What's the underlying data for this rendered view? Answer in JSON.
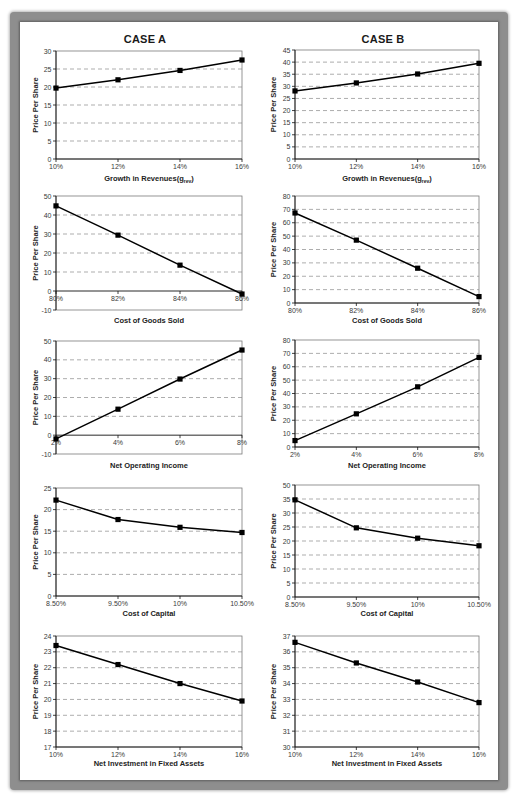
{
  "headings": {
    "case_a": "CASE A",
    "case_b": "CASE B"
  },
  "chart_data": [
    {
      "id": "case-a-growth-in-revenues",
      "case": "CASE A",
      "type": "line",
      "title": "",
      "xlabel": "Growth in Revenues(grev)",
      "xlabel_parts": [
        {
          "text": "Growth in Revenues(g"
        },
        {
          "text": "rev",
          "sub": true
        },
        {
          "text": ")"
        }
      ],
      "ylabel": "Price Per Share",
      "categories": [
        "10%",
        "12%",
        "14%",
        "16%"
      ],
      "values": [
        19.7,
        22.0,
        24.6,
        27.5
      ],
      "ylim": [
        0,
        30
      ],
      "yticks": [
        0,
        5,
        10,
        15,
        20,
        25,
        30
      ],
      "ytick_labels": [
        "0",
        "5",
        "10",
        "15",
        "20",
        "25",
        "30"
      ],
      "grid": true,
      "legend": null
    },
    {
      "id": "case-b-growth-in-revenues",
      "case": "CASE B",
      "type": "line",
      "title": "",
      "xlabel": "Growth in Revenues(grev)",
      "xlabel_parts": [
        {
          "text": "Growth in Revenues(g"
        },
        {
          "text": "rev",
          "sub": true
        },
        {
          "text": ")"
        }
      ],
      "ylabel": "Price Per Share",
      "categories": [
        "10%",
        "12%",
        "14%",
        "16%"
      ],
      "values": [
        28.1,
        31.4,
        35.1,
        39.5
      ],
      "ylim": [
        0,
        45
      ],
      "yticks": [
        0,
        5,
        10,
        15,
        20,
        25,
        30,
        35,
        40,
        45
      ],
      "ytick_labels": [
        "0",
        "5",
        "10",
        "15",
        "20",
        "25",
        "30",
        "35",
        "40",
        "45"
      ],
      "grid": true,
      "legend": null
    },
    {
      "id": "case-a-cost-of-goods-sold",
      "case": "CASE A",
      "type": "line",
      "title": "",
      "xlabel": "Cost of Goods Sold",
      "xlabel_parts": [
        {
          "text": "Cost of Goods Sold"
        }
      ],
      "ylabel": "Price Per Share",
      "categories": [
        "80%",
        "82%",
        "84%",
        "86%"
      ],
      "values": [
        44.8,
        29.4,
        13.6,
        -1.6
      ],
      "ylim": [
        -10,
        50
      ],
      "yticks": [
        -10,
        0,
        10,
        20,
        30,
        40,
        50
      ],
      "ytick_labels": [
        "-10",
        "0",
        "10",
        "20",
        "30",
        "40",
        "50"
      ],
      "grid": true,
      "legend": null
    },
    {
      "id": "case-b-cost-of-goods-sold",
      "case": "CASE B",
      "type": "line",
      "title": "",
      "xlabel": "Cost of Goods Sold",
      "xlabel_parts": [
        {
          "text": "Cost of Goods Sold"
        }
      ],
      "ylabel": "Price Per Share",
      "categories": [
        "80%",
        "82%",
        "84%",
        "86%"
      ],
      "values": [
        67.3,
        47.0,
        26.0,
        4.8
      ],
      "ylim": [
        0,
        80
      ],
      "yticks": [
        0,
        10,
        20,
        30,
        40,
        50,
        60,
        70,
        80
      ],
      "ytick_labels": [
        "0",
        "10",
        "20",
        "30",
        "40",
        "50",
        "60",
        "70",
        "80"
      ],
      "grid": true,
      "legend": null
    },
    {
      "id": "case-a-net-operating-income",
      "case": "CASE A",
      "type": "line",
      "title": "",
      "xlabel": "Net Operating Income",
      "xlabel_parts": [
        {
          "text": "Net Operating Income"
        }
      ],
      "ylabel": "Price Per Share",
      "categories": [
        "2%",
        "4%",
        "6%",
        "8%"
      ],
      "values": [
        -2.0,
        13.8,
        29.8,
        45.2
      ],
      "ylim": [
        -10,
        50
      ],
      "yticks": [
        -10,
        0,
        10,
        20,
        30,
        40,
        50
      ],
      "ytick_labels": [
        "-10",
        "0",
        "10",
        "20",
        "30",
        "40",
        "50"
      ],
      "grid": true,
      "legend": null
    },
    {
      "id": "case-b-net-operating-income",
      "case": "CASE B",
      "type": "line",
      "title": "",
      "xlabel": "Net Operating Income",
      "xlabel_parts": [
        {
          "text": "Net Operating Income"
        }
      ],
      "ylabel": "Price Per Share",
      "categories": [
        "2%",
        "4%",
        "6%",
        "8%"
      ],
      "values": [
        4.8,
        24.8,
        45.0,
        67.0
      ],
      "ylim": [
        0,
        80
      ],
      "yticks": [
        0,
        10,
        20,
        30,
        40,
        50,
        60,
        70,
        80
      ],
      "ytick_labels": [
        "0",
        "10",
        "20",
        "30",
        "40",
        "50",
        "60",
        "70",
        "80"
      ],
      "grid": true,
      "legend": null
    },
    {
      "id": "case-a-cost-of-capital",
      "case": "CASE A",
      "type": "line",
      "title": "",
      "xlabel": "Cost of Capital",
      "xlabel_parts": [
        {
          "text": "Cost of Capital"
        }
      ],
      "ylabel": "Price Per Share",
      "categories": [
        "8.50%",
        "9.50%",
        "10%",
        "10.50%"
      ],
      "values": [
        22.2,
        17.7,
        15.9,
        14.7
      ],
      "ylim": [
        0,
        25
      ],
      "yticks": [
        0,
        5,
        10,
        15,
        20,
        25
      ],
      "ytick_labels": [
        "0",
        "5",
        "10",
        "15",
        "20",
        "25"
      ],
      "grid": true,
      "legend": null
    },
    {
      "id": "case-b-cost-of-capital",
      "case": "CASE B",
      "type": "line",
      "title": "",
      "xlabel": "Cost of Capital",
      "xlabel_parts": [
        {
          "text": "Cost of Capital"
        }
      ],
      "ylabel": "Price Per Share",
      "categories": [
        "8.50%",
        "9.50%",
        "10%",
        "10.50%"
      ],
      "values": [
        34.7,
        24.7,
        21.0,
        18.3
      ],
      "ylim": [
        0,
        40
      ],
      "yticks": [
        0,
        5,
        10,
        15,
        20,
        25,
        30,
        35,
        40
      ],
      "ytick_labels": [
        "0",
        "5",
        "10",
        "15",
        "20",
        "25",
        "30",
        "35",
        "50"
      ],
      "grid": true,
      "legend": null
    },
    {
      "id": "case-a-net-investment-fixed-assets",
      "case": "CASE A",
      "type": "line",
      "title": "",
      "xlabel": "Net Investment in Fixed Assets",
      "xlabel_parts": [
        {
          "text": "Net Investment in Fixed Assets"
        }
      ],
      "ylabel": "Price Per Share",
      "categories": [
        "10%",
        "12%",
        "14%",
        "16%"
      ],
      "values": [
        23.4,
        22.2,
        21.0,
        19.9
      ],
      "ylim": [
        17,
        24
      ],
      "yticks": [
        17,
        18,
        19,
        20,
        21,
        22,
        23,
        24
      ],
      "ytick_labels": [
        "17",
        "18",
        "19",
        "20",
        "21",
        "22",
        "23",
        "24"
      ],
      "grid": true,
      "legend": null
    },
    {
      "id": "case-b-net-investment-fixed-assets",
      "case": "CASE B",
      "type": "line",
      "title": "",
      "xlabel": "Net Investment in Fixed Assets",
      "xlabel_parts": [
        {
          "text": "Net Investment in Fixed Assets"
        }
      ],
      "ylabel": "Price Per Share",
      "categories": [
        "10%",
        "12%",
        "14%",
        "16%"
      ],
      "values": [
        36.6,
        35.3,
        34.1,
        32.8
      ],
      "ylim": [
        30,
        37
      ],
      "yticks": [
        30,
        31,
        32,
        33,
        34,
        35,
        36,
        37
      ],
      "ytick_labels": [
        "30",
        "31",
        "32",
        "33",
        "34",
        "35",
        "36",
        "37"
      ],
      "grid": true,
      "legend": null
    }
  ]
}
